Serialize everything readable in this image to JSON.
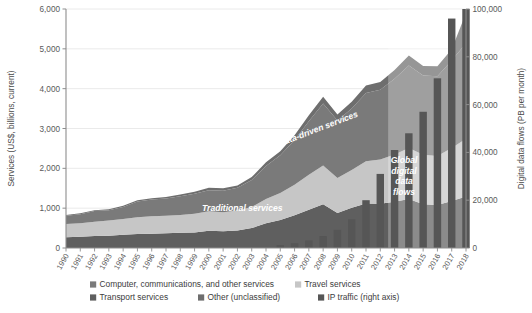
{
  "chart_data": {
    "type": "area",
    "title": "",
    "subtitle": "",
    "xlabel": "",
    "ylabel": "Services (US$, billions, current)",
    "y2label": "Digital data flows (PB per month)",
    "grid": true,
    "legend_position": "bottom",
    "ylim": [
      0,
      6000
    ],
    "y2lim": [
      0,
      100000
    ],
    "yticks": [
      0,
      1000,
      2000,
      3000,
      4000,
      5000,
      6000
    ],
    "ytick_labels": [
      "0",
      "1,000",
      "2,000",
      "3,000",
      "4,000",
      "5,000",
      "6,000"
    ],
    "y2ticks": [
      0,
      20000,
      40000,
      60000,
      80000,
      100000
    ],
    "y2tick_labels": [
      "0",
      "20,000",
      "40,000",
      "60,000",
      "80,000",
      "100,000"
    ],
    "categories": [
      "1990",
      "1991",
      "1992",
      "1993",
      "1994",
      "1995",
      "1996",
      "1997",
      "1998",
      "1999",
      "2000",
      "2001",
      "2002",
      "2003",
      "2004",
      "2005",
      "2006",
      "2007",
      "2008",
      "2009",
      "2010",
      "2011",
      "2012",
      "2013",
      "2014",
      "2015",
      "2016",
      "2017",
      "2018"
    ],
    "series": [
      {
        "name": "Transport services",
        "type": "area",
        "color": "#5f5f5f",
        "values": [
          270,
          280,
          300,
          310,
          330,
          350,
          360,
          370,
          380,
          390,
          430,
          420,
          440,
          500,
          620,
          700,
          820,
          960,
          1100,
          880,
          1010,
          1120,
          1110,
          1160,
          1230,
          1100,
          1080,
          1180,
          1290
        ]
      },
      {
        "name": "Travel services",
        "type": "area",
        "color": "#c6c6c6",
        "values": [
          330,
          340,
          360,
          380,
          400,
          420,
          440,
          440,
          450,
          470,
          490,
          480,
          500,
          530,
          610,
          680,
          770,
          880,
          970,
          880,
          950,
          1060,
          1110,
          1190,
          1280,
          1240,
          1230,
          1330,
          1450
        ]
      },
      {
        "name": "Computer, communications, and other services",
        "type": "area",
        "color": "#7a7a7a",
        "values": [
          210,
          230,
          270,
          260,
          300,
          400,
          420,
          430,
          470,
          500,
          530,
          540,
          570,
          680,
          830,
          950,
          1120,
          1340,
          1560,
          1440,
          1540,
          1710,
          1750,
          1900,
          2070,
          1990,
          2000,
          2200,
          2400
        ]
      },
      {
        "name": "Other (unclassified)",
        "type": "area",
        "color": "#6e6e6e",
        "values": [
          20,
          20,
          20,
          20,
          30,
          30,
          30,
          40,
          40,
          50,
          60,
          60,
          60,
          70,
          90,
          100,
          120,
          150,
          170,
          150,
          170,
          190,
          200,
          220,
          250,
          240,
          250,
          280,
          760
        ]
      },
      {
        "name": "IP traffic (right axis)",
        "type": "bar",
        "color": "#565656",
        "axis": "right",
        "values": [
          0,
          0,
          0,
          0,
          0,
          0,
          0,
          0,
          0,
          0,
          0,
          0,
          0,
          0,
          0,
          1200,
          2000,
          3200,
          5000,
          7600,
          12000,
          20000,
          31000,
          41000,
          48000,
          57000,
          71000,
          96000,
          100000
        ]
      }
    ],
    "annotations": [
      {
        "text": "Traditional services",
        "x": 0.42,
        "y": 0.28,
        "rotation": 0
      },
      {
        "text": "Data-driven services",
        "x": 0.63,
        "y": 0.58,
        "rotation": -20
      },
      {
        "text": "Global digital data flows",
        "x": 0.8,
        "y": 0.3,
        "rotation": 0
      }
    ],
    "overlay_box": {
      "start_category": "2013",
      "end_category": "2018",
      "color": "#ffffff",
      "opacity": 0.28
    }
  },
  "legend": {
    "items": [
      {
        "label": "Computer, communications, and other services",
        "color": "#7a7a7a"
      },
      {
        "label": "Travel services",
        "color": "#c6c6c6"
      },
      {
        "label": "Transport services",
        "color": "#5f5f5f"
      },
      {
        "label": "Other (unclassified)",
        "color": "#6e6e6e"
      },
      {
        "label": "IP traffic (right axis)",
        "color": "#565656"
      }
    ]
  },
  "annotation_text": {
    "traditional": "Traditional services",
    "data_driven": "Data-driven services",
    "global_1": "Global",
    "global_2": "digital",
    "global_3": "data",
    "global_4": "flows"
  },
  "axes": {
    "left_title": "Services (US$, billions, current)",
    "right_title": "Digital data flows (PB per month)"
  }
}
